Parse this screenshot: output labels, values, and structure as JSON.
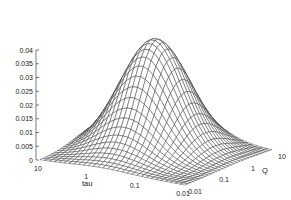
{
  "chart_data": {
    "type": "surface3d",
    "title": "",
    "style": "wireframe mesh, hidden-line",
    "x_axis": {
      "label": "tau",
      "scale": "log",
      "ticks": [
        "10",
        "1",
        "0.1",
        "0.01"
      ],
      "range": [
        0.01,
        10
      ]
    },
    "y_axis": {
      "label": "Q",
      "scale": "log",
      "ticks": [
        "0.01",
        "0.1",
        "1",
        "10"
      ],
      "range": [
        0.01,
        10
      ]
    },
    "z_axis": {
      "label": "",
      "ticks": [
        "0",
        "0.005",
        "0.01",
        "0.015",
        "0.02",
        "0.025",
        "0.03",
        "0.035",
        "0.04"
      ],
      "range": [
        0,
        0.04
      ]
    },
    "surface": {
      "shape": "single gaussian-like hump",
      "peak_z": 0.04,
      "peak_location": "center of log(tau)-log(Q) domain",
      "base_z": 0
    },
    "grid": false,
    "legend": null
  },
  "colors": {
    "line": "#333333",
    "background": "#ffffff"
  }
}
